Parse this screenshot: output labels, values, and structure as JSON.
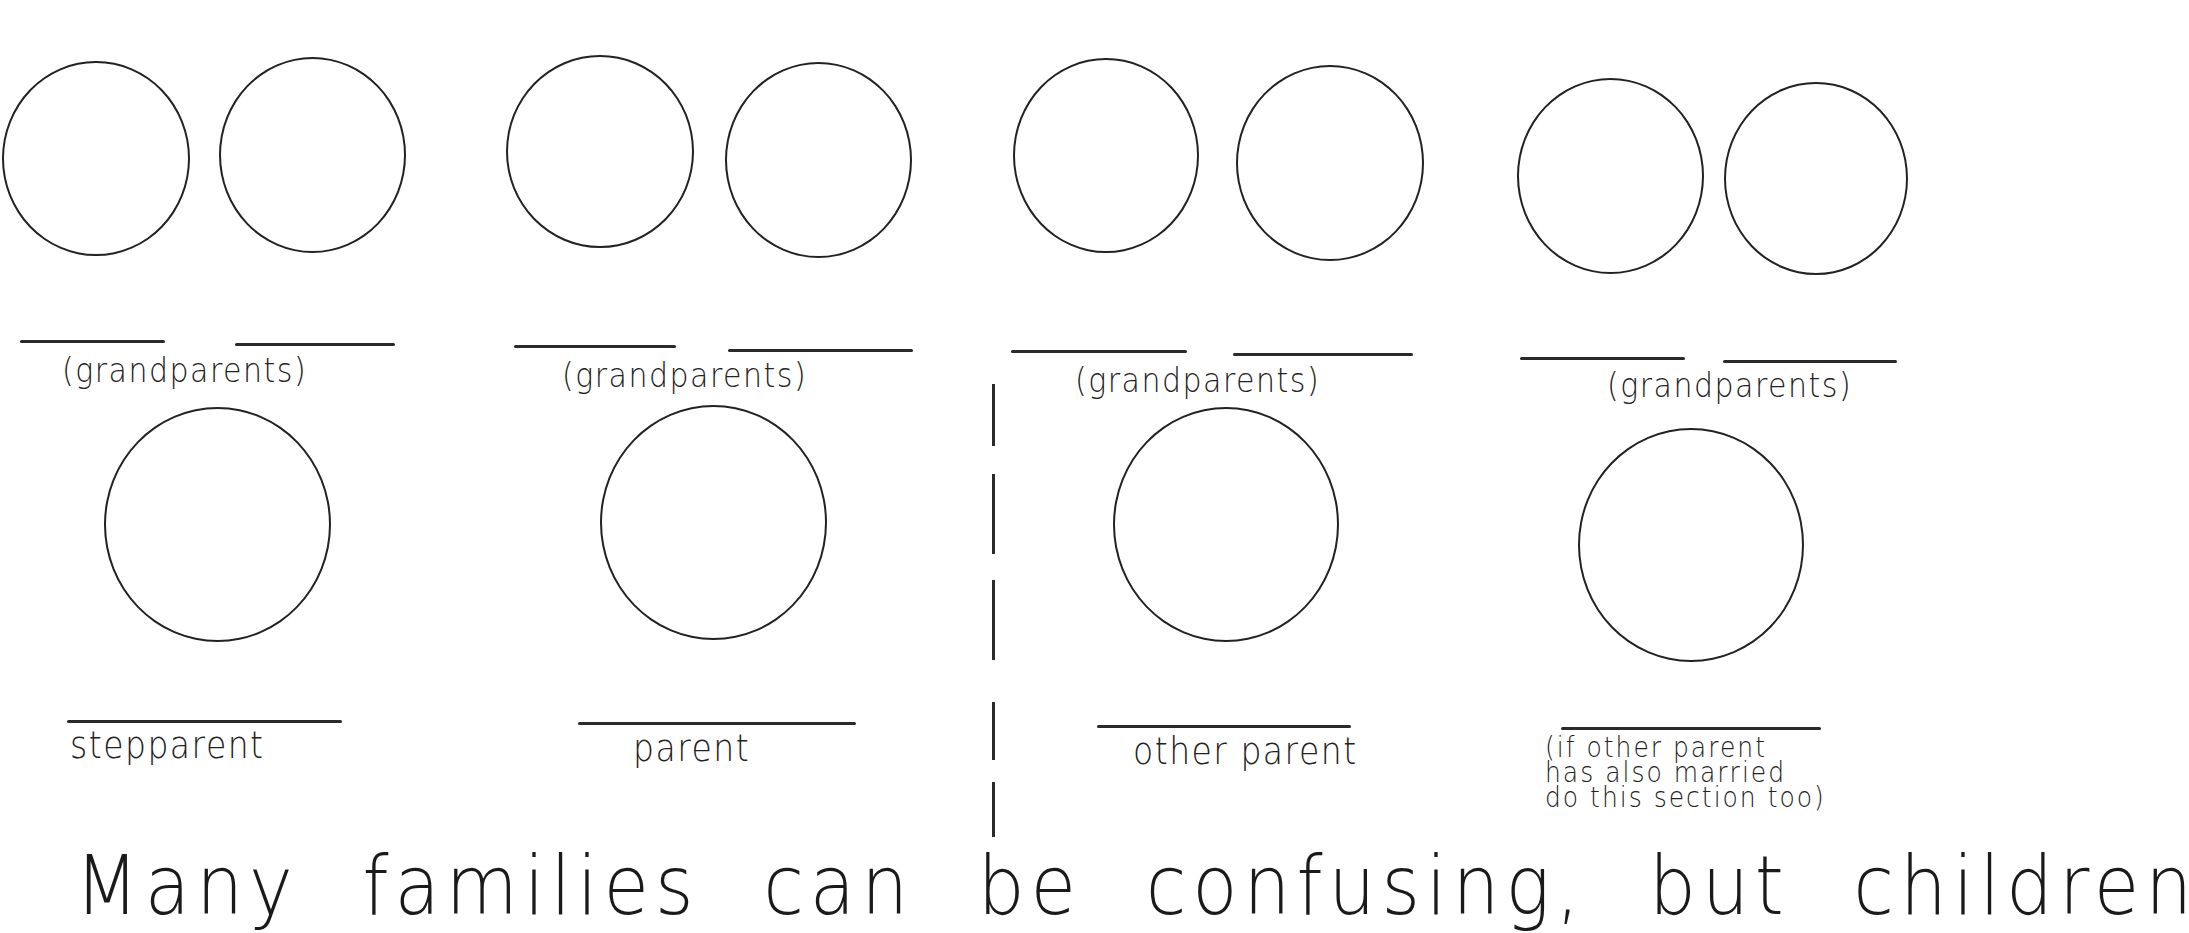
{
  "worksheet": {
    "columns": [
      {
        "id": "stepparent-side",
        "grandparents_label": "(grandparents)",
        "parent_label": "stepparent"
      },
      {
        "id": "parent-side",
        "grandparents_label": "(grandparents)",
        "parent_label": "parent"
      },
      {
        "id": "other-parent-side",
        "grandparents_label": "(grandparents)",
        "parent_label": "other parent"
      },
      {
        "id": "other-stepparent-side",
        "grandparents_label": "(grandparents)",
        "parent_label": "(if other parent\nhas also married\ndo this section too)"
      }
    ],
    "headline": "Many  families  can  be  confusing,  but  children"
  },
  "colors": {
    "ink": "#222222",
    "paper": "#ffffff"
  }
}
